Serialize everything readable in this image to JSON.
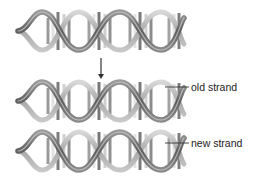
{
  "diagram": {
    "type": "dna-replication",
    "helices": [
      {
        "id": "parent",
        "x": 18,
        "y": 10,
        "width": 166,
        "height": 42
      },
      {
        "id": "daughter-1",
        "x": 18,
        "y": 80,
        "width": 166,
        "height": 42
      },
      {
        "id": "daughter-2",
        "x": 18,
        "y": 130,
        "width": 166,
        "height": 42
      }
    ],
    "arrow": {
      "x": 101,
      "y1": 58,
      "y2": 78
    },
    "labels": {
      "old_strand": "old strand",
      "new_strand": "new strand"
    },
    "colors": {
      "strand_dark": "#6e6e6e",
      "strand_light": "#b8b8b8",
      "base_dark": "#8a8a8a",
      "base_light": "#e4e4e4",
      "line": "#333333"
    }
  }
}
